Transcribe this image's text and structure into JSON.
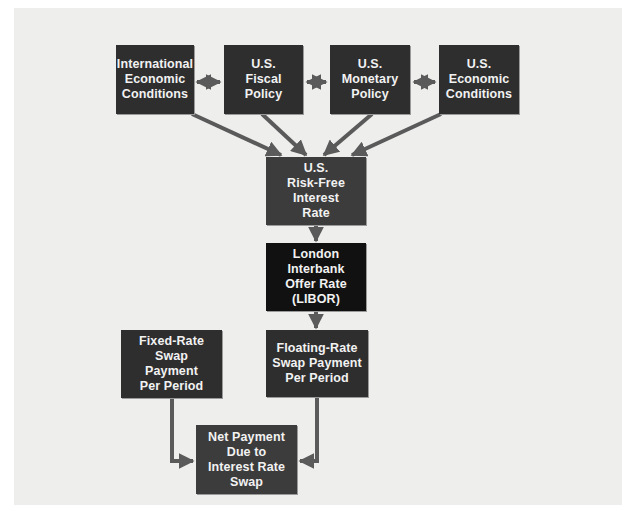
{
  "diagram": {
    "colors": {
      "panel": "#eeeeec",
      "box_dark": "#2e2e2e",
      "box_mid": "#3c3c3c",
      "box_black": "#111111",
      "connector": "#5a5a5a",
      "text": "#f2f2f2"
    },
    "nodes": {
      "intl": {
        "label": "International\nEconomic\nConditions"
      },
      "fiscal": {
        "label": "U.S.\nFiscal\nPolicy"
      },
      "monetary": {
        "label": "U.S.\nMonetary\nPolicy"
      },
      "econ": {
        "label": "U.S.\nEconomic\nConditions"
      },
      "riskfree": {
        "label": "U.S.\nRisk-Free\nInterest\nRate"
      },
      "libor": {
        "label": "London Interbank\nOffer Rate\n(LIBOR)"
      },
      "fixed": {
        "label": "Fixed-Rate\nSwap\nPayment\nPer Period"
      },
      "floating": {
        "label": "Floating-Rate\nSwap Payment\nPer Period"
      },
      "net": {
        "label": "Net Payment\nDue to\nInterest Rate\nSwap"
      }
    },
    "edges": [
      {
        "from": "intl",
        "to": "fiscal",
        "type": "bidirectional"
      },
      {
        "from": "fiscal",
        "to": "monetary",
        "type": "bidirectional"
      },
      {
        "from": "monetary",
        "to": "econ",
        "type": "bidirectional"
      },
      {
        "from": "intl",
        "to": "riskfree",
        "type": "arrow"
      },
      {
        "from": "fiscal",
        "to": "riskfree",
        "type": "arrow"
      },
      {
        "from": "monetary",
        "to": "riskfree",
        "type": "arrow"
      },
      {
        "from": "econ",
        "to": "riskfree",
        "type": "arrow"
      },
      {
        "from": "riskfree",
        "to": "libor",
        "type": "arrow"
      },
      {
        "from": "libor",
        "to": "floating",
        "type": "arrow"
      },
      {
        "from": "fixed",
        "to": "net",
        "type": "arrow"
      },
      {
        "from": "floating",
        "to": "net",
        "type": "arrow"
      }
    ]
  }
}
